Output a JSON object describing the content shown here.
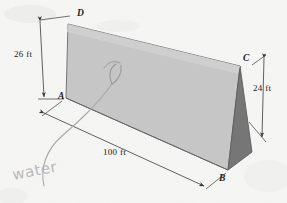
{
  "figure": {
    "kind": "triangular-prism-diagram",
    "background_color": "#fbfbfa",
    "faces": {
      "front_color": "#c6c6c6",
      "end_color": "#767676",
      "outline_color": "#5a5a5a"
    },
    "vertices": [
      {
        "id": "D",
        "label": "D",
        "x": 77,
        "y": 14
      },
      {
        "id": "A",
        "label": "A",
        "x": 58,
        "y": 97
      },
      {
        "id": "C",
        "label": "C",
        "x": 243,
        "y": 59
      },
      {
        "id": "B",
        "label": "B",
        "x": 219,
        "y": 179
      }
    ],
    "dimensions": [
      {
        "id": "left",
        "label": "26 ft",
        "x": 14,
        "y": 54,
        "value": 26,
        "unit": "ft"
      },
      {
        "id": "right",
        "label": "24 ft",
        "x": 253,
        "y": 88,
        "value": 24,
        "unit": "ft"
      },
      {
        "id": "bottom",
        "label": "100 ft",
        "x": 103,
        "y": 152,
        "value": 100,
        "unit": "ft"
      }
    ],
    "annotations": [
      {
        "id": "water-note",
        "label": "water",
        "x": 14,
        "y": 180,
        "style": "handwritten-pencil"
      }
    ]
  }
}
